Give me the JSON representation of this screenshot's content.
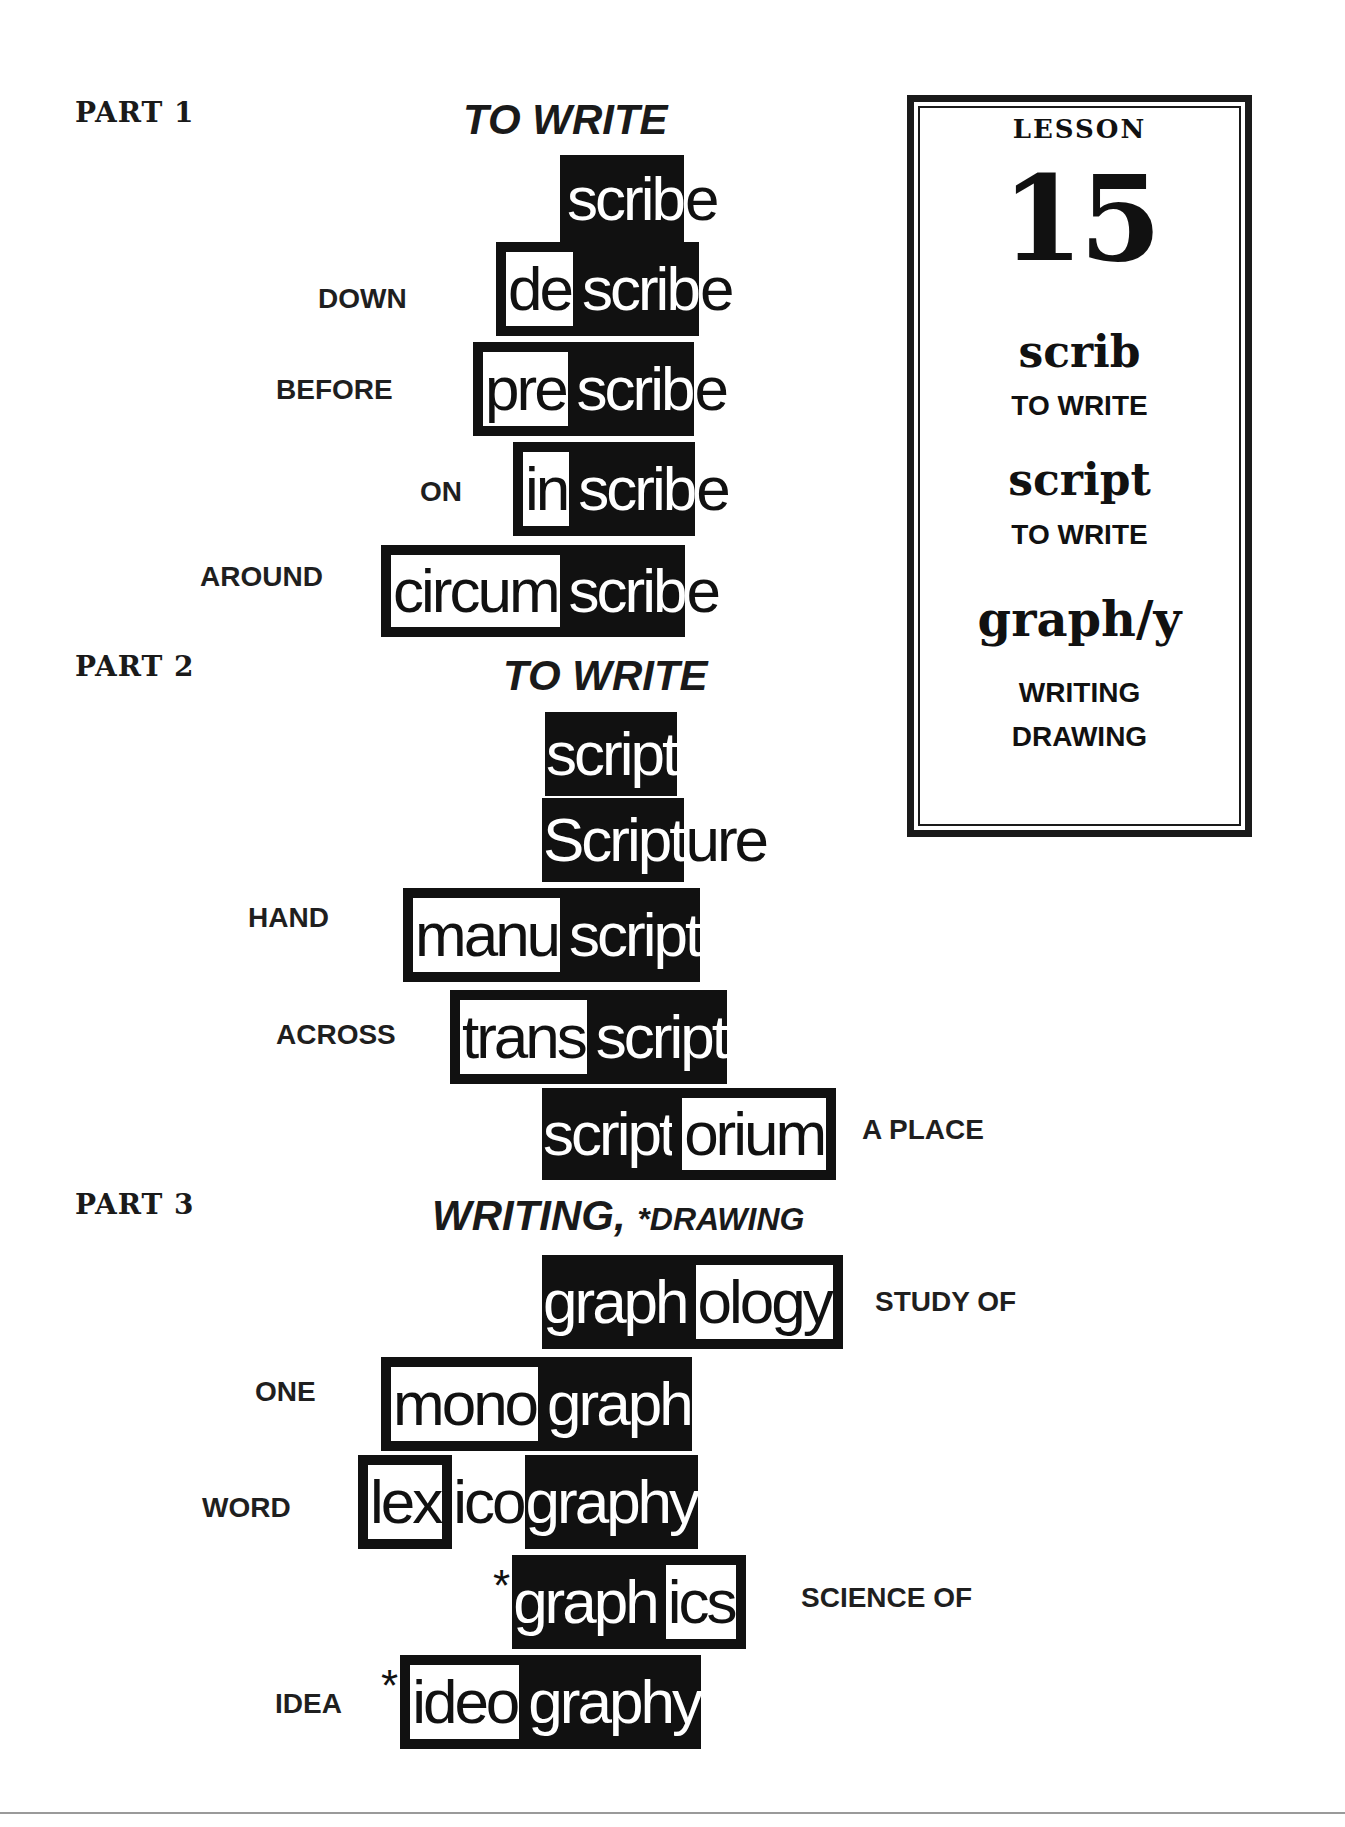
{
  "lesson": {
    "label": "LESSON",
    "number": "15",
    "roots": [
      {
        "root": "scrib",
        "meaning": "TO WRITE"
      },
      {
        "root": "script",
        "meaning": "TO WRITE"
      },
      {
        "root": "graph/y",
        "meaning_line1": "WRITING",
        "meaning_line2": "DRAWING"
      }
    ]
  },
  "parts": [
    {
      "label": "PART 1",
      "title": "TO WRITE",
      "words": [
        {
          "gloss": "",
          "segments": [
            {
              "text": "scrib",
              "style": "root"
            },
            {
              "text": "e",
              "style": "plain"
            }
          ]
        },
        {
          "gloss": "DOWN",
          "segments": [
            {
              "text": "de",
              "style": "boxed"
            },
            {
              "text": "scrib",
              "style": "root"
            },
            {
              "text": "e",
              "style": "plain"
            }
          ]
        },
        {
          "gloss": "BEFORE",
          "segments": [
            {
              "text": "pre",
              "style": "boxed"
            },
            {
              "text": "scrib",
              "style": "root"
            },
            {
              "text": "e",
              "style": "plain"
            }
          ]
        },
        {
          "gloss": "ON",
          "segments": [
            {
              "text": "in",
              "style": "boxed"
            },
            {
              "text": "scrib",
              "style": "root"
            },
            {
              "text": "e",
              "style": "plain"
            }
          ]
        },
        {
          "gloss": "AROUND",
          "segments": [
            {
              "text": "circum",
              "style": "boxed"
            },
            {
              "text": "scrib",
              "style": "root"
            },
            {
              "text": "e",
              "style": "plain"
            }
          ]
        }
      ]
    },
    {
      "label": "PART 2",
      "title": "TO WRITE",
      "words": [
        {
          "gloss": "",
          "segments": [
            {
              "text": "script",
              "style": "root"
            }
          ]
        },
        {
          "gloss": "",
          "segments": [
            {
              "text": "Script",
              "style": "root"
            },
            {
              "text": "ure",
              "style": "plain"
            }
          ]
        },
        {
          "gloss": "HAND",
          "segments": [
            {
              "text": "manu",
              "style": "boxed"
            },
            {
              "text": "script",
              "style": "root"
            }
          ]
        },
        {
          "gloss": "ACROSS",
          "segments": [
            {
              "text": "trans",
              "style": "boxed"
            },
            {
              "text": "script",
              "style": "root"
            }
          ]
        },
        {
          "gloss_right": "A PLACE",
          "segments": [
            {
              "text": "script",
              "style": "root"
            },
            {
              "text": "orium",
              "style": "boxed"
            }
          ]
        }
      ]
    },
    {
      "label": "PART 3",
      "title_main": "WRITING,",
      "title_star": "*DRAWING",
      "words": [
        {
          "gloss_right": "STUDY OF",
          "segments": [
            {
              "text": "graph",
              "style": "root"
            },
            {
              "text": "ology",
              "style": "boxed"
            }
          ]
        },
        {
          "gloss": "ONE",
          "segments": [
            {
              "text": "mono",
              "style": "boxed"
            },
            {
              "text": "graph",
              "style": "root"
            }
          ]
        },
        {
          "gloss": "WORD",
          "segments": [
            {
              "text": "lex",
              "style": "boxed"
            },
            {
              "text": "ico",
              "style": "plain"
            },
            {
              "text": "graphy",
              "style": "root"
            }
          ]
        },
        {
          "gloss_right": "SCIENCE OF",
          "star": "*",
          "segments": [
            {
              "text": "graph",
              "style": "root"
            },
            {
              "text": "ics",
              "style": "boxed"
            }
          ]
        },
        {
          "gloss": "IDEA",
          "star": "*",
          "segments": [
            {
              "text": "ideo",
              "style": "boxed"
            },
            {
              "text": "graphy",
              "style": "root"
            }
          ]
        }
      ]
    }
  ]
}
